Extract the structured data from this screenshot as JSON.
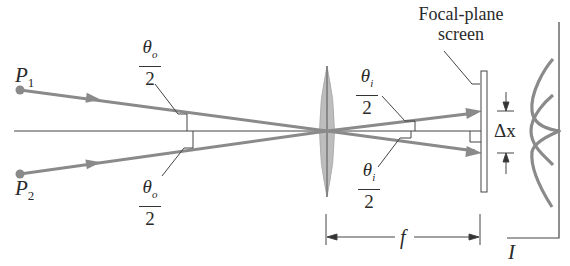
{
  "labels": {
    "p1": "P",
    "p1_sub": "1",
    "p2": "P",
    "p2_sub": "2",
    "theta_o_top_num": "θ",
    "theta_o_top_sub": "o",
    "theta_o_top_den": "2",
    "theta_o_bottom_num": "θ",
    "theta_o_bottom_sub": "o",
    "theta_o_bottom_den": "2",
    "theta_i_top_num": "θ",
    "theta_i_top_sub": "i",
    "theta_i_top_den": "2",
    "theta_i_bottom_num": "θ",
    "theta_i_bottom_sub": "i",
    "theta_i_bottom_den": "2",
    "screen_line1": "Focal-plane",
    "screen_line2": "screen",
    "delta_x": "Δx",
    "focal_length": "f",
    "intensity": "I"
  },
  "colors": {
    "ray": "#8a8a8a",
    "lens": "#b8b8b8",
    "line": "#333333",
    "text": "#2a2a2a"
  }
}
